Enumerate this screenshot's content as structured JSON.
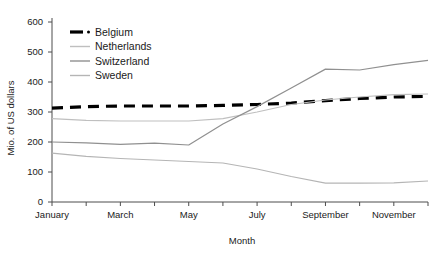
{
  "chart_data": {
    "type": "line",
    "title": "",
    "xlabel": "Month",
    "ylabel": "Mio. of US dollars",
    "x": [
      "January",
      "February",
      "March",
      "April",
      "May",
      "June",
      "July",
      "August",
      "September",
      "October",
      "November",
      "December"
    ],
    "xtick_labels": [
      "January",
      "",
      "March",
      "",
      "May",
      "",
      "July",
      "",
      "September",
      "",
      "November",
      ""
    ],
    "ytick_labels": [
      "0",
      "100",
      "200",
      "300",
      "400",
      "500",
      "600"
    ],
    "yticks": [
      0,
      100,
      200,
      300,
      400,
      500,
      600
    ],
    "ylim": [
      0,
      600
    ],
    "grid": false,
    "legend_position": "top-left",
    "series": [
      {
        "name": "Belgium",
        "color": "#000000",
        "style": "dashed",
        "values": [
          313,
          318,
          320,
          320,
          320,
          322,
          325,
          330,
          338,
          345,
          350,
          352
        ]
      },
      {
        "name": "Netherlands",
        "color": "#bfbfbf",
        "style": "solid",
        "values": [
          278,
          272,
          270,
          270,
          270,
          278,
          300,
          325,
          340,
          350,
          358,
          360
        ]
      },
      {
        "name": "Switzerland",
        "color": "#909090",
        "style": "solid",
        "values": [
          200,
          197,
          192,
          196,
          190,
          260,
          318,
          380,
          443,
          440,
          458,
          472
        ]
      },
      {
        "name": "Sweden",
        "color": "#b5b5b5",
        "style": "solid",
        "values": [
          163,
          152,
          145,
          140,
          135,
          130,
          110,
          85,
          63,
          63,
          64,
          70
        ]
      }
    ]
  },
  "legend": {
    "items": [
      {
        "label": "Belgium"
      },
      {
        "label": "Netherlands"
      },
      {
        "label": "Switzerland"
      },
      {
        "label": "Sweden"
      }
    ]
  }
}
